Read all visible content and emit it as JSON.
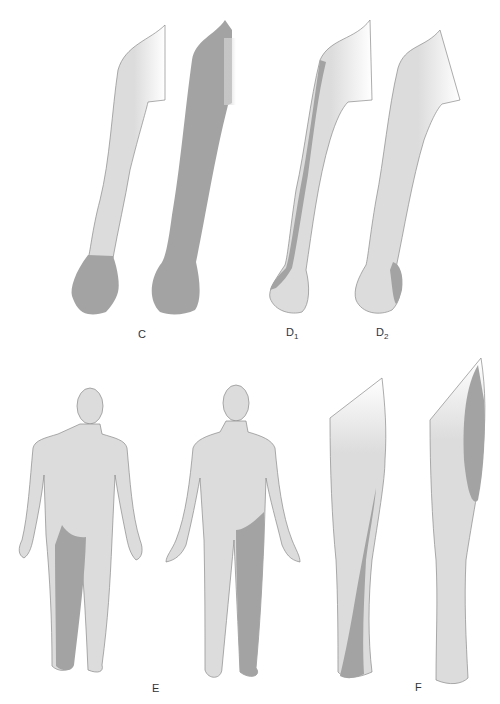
{
  "figure": {
    "type": "dermatome-illustration",
    "colors": {
      "skin": "#dcdcdc",
      "shaded": "#a3a3a3",
      "outline": "#8a8a8a",
      "background": "#ffffff"
    },
    "panels": [
      {
        "id": "C",
        "label": "C",
        "subscript": "",
        "description": "Two arms: whole hand shaded; entire arm shaded"
      },
      {
        "id": "D1",
        "label": "D",
        "subscript": "1",
        "description": "Arm with lateral (radial) strip shaded to thumb"
      },
      {
        "id": "D2",
        "label": "D",
        "subscript": "2",
        "description": "Arm with ulnar border of hand shaded"
      },
      {
        "id": "E",
        "label": "E",
        "subscript": "",
        "description": "Whole body posterior and anterior view with one leg shaded"
      },
      {
        "id": "F",
        "label": "F",
        "subscript": "",
        "description": "Leg lateral strip and anterior thigh shaded"
      }
    ]
  }
}
